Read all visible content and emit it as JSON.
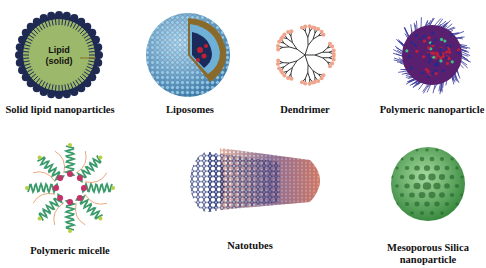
{
  "figure": {
    "items": [
      {
        "id": "solid-lipid",
        "label": "Solid lipid nanoparticles",
        "inner_text_1": "Lipid",
        "inner_text_2": "(solid)"
      },
      {
        "id": "liposomes",
        "label": "Liposomes"
      },
      {
        "id": "dendrimer",
        "label": "Dendrimer"
      },
      {
        "id": "polymeric-nanoparticle",
        "label": "Polymeric nanoparticle"
      },
      {
        "id": "polymeric-micelle",
        "label": "Polymeric micelle"
      },
      {
        "id": "nanotubes",
        "label": "Natotubes"
      },
      {
        "id": "mesoporous-silica",
        "label_line1": "Mesoporous Silica",
        "label_line2": "nanoparticle"
      }
    ]
  },
  "colors": {
    "lipid_core": "#9cb86a",
    "lipid_heads": "#1e2a52",
    "liposome_blue": "#7fb6d8",
    "liposome_tail": "#8a6a2a",
    "dendrimer_pink": "#f0a48c",
    "polymer_red": "#c0203a",
    "polymer_blue": "#2a2a8a",
    "micelle_green": "#3a9a6a",
    "micelle_red": "#c8306a",
    "nanotube_blue": "#1a2a70",
    "nanotube_orange": "#d0603a",
    "silica_green": "#6ab86a"
  }
}
